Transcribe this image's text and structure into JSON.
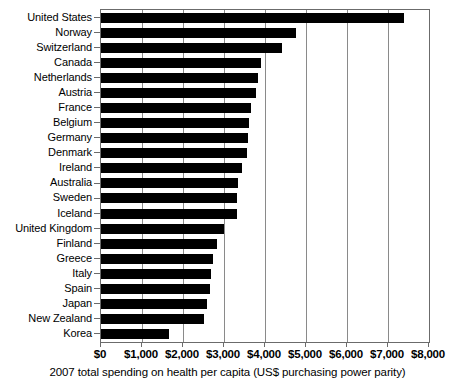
{
  "chart_data": {
    "type": "bar",
    "orientation": "horizontal",
    "title": "",
    "xlabel": "2007 total spending on health per capita (US$ purchasing power parity)",
    "ylabel": "",
    "xlim": [
      0,
      8000
    ],
    "xticks": [
      0,
      1000,
      2000,
      3000,
      4000,
      5000,
      6000,
      7000,
      8000
    ],
    "xticklabels": [
      "$0",
      "$1,000",
      "$2,000",
      "$3,000",
      "$4,000",
      "$5,000",
      "$6,000",
      "$7,000",
      "$8,000"
    ],
    "grid": "vertical",
    "legend": "none",
    "bar_color": "#000000",
    "categories": [
      "United States",
      "Norway",
      "Switzerland",
      "Canada",
      "Netherlands",
      "Austria",
      "France",
      "Belgium",
      "Germany",
      "Denmark",
      "Ireland",
      "Australia",
      "Sweden",
      "Iceland",
      "United Kingdom",
      "Finland",
      "Greece",
      "Italy",
      "Spain",
      "Japan",
      "New Zealand",
      "Korea"
    ],
    "values": [
      7400,
      4760,
      4420,
      3900,
      3840,
      3780,
      3650,
      3600,
      3590,
      3550,
      3450,
      3350,
      3320,
      3320,
      2990,
      2840,
      2730,
      2690,
      2670,
      2580,
      2510,
      1650
    ]
  }
}
